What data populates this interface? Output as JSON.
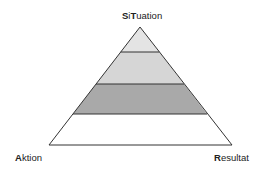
{
  "diagram": {
    "type": "pyramid",
    "labels": {
      "top": {
        "bold": "S",
        "rest1": "i",
        "bold2": "T",
        "rest2": "uation",
        "full": "SiTuation"
      },
      "left": {
        "bold": "A",
        "rest": "ktion",
        "full": "Aktion"
      },
      "right": {
        "bold": "R",
        "rest": "esultat",
        "full": "Resultat"
      }
    },
    "layers": [
      {
        "index": 1,
        "fill": "#e4e4e4"
      },
      {
        "index": 2,
        "fill": "#d6d6d6"
      },
      {
        "index": 3,
        "fill": "#a9a9a9"
      },
      {
        "index": 4,
        "fill": "#ffffff"
      }
    ],
    "stroke": "#333333"
  }
}
